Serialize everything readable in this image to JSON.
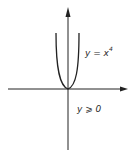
{
  "diagram": {
    "type": "function-graph",
    "curve_label": "y = x",
    "curve_exponent": "4",
    "range_label": "y ⩾ 0",
    "line_color": "#222222",
    "axes": {
      "x_arrow": "right",
      "y_arrow": "up"
    }
  }
}
